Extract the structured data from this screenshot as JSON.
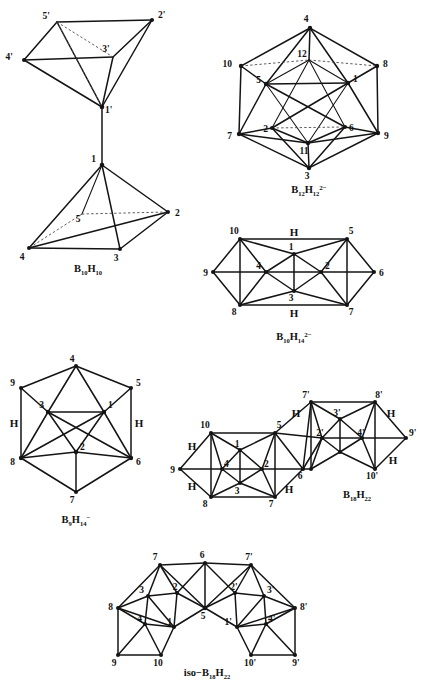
{
  "figure": {
    "background_color": "#ffffff",
    "line_color": "#141414",
    "structure_count": 6
  },
  "structures": [
    {
      "id": "b10h10",
      "name": "bisdisphenoid-bicapped-square-antiprism-diagram",
      "formula_plain": "B10H10",
      "formula": {
        "element1": "B",
        "sub1": "10",
        "element2": "H",
        "sub2": "10",
        "charge": ""
      },
      "vertex_labels": [
        "5'",
        "2'",
        "4'",
        "3'",
        "1'",
        "1",
        "5",
        "2",
        "4",
        "3"
      ],
      "bridge_labels": [],
      "vertices": [
        {
          "label": "5'",
          "x": 57,
          "y": 22,
          "lx": 50,
          "ly": 19,
          "dot": false
        },
        {
          "label": "2'",
          "x": 152,
          "y": 20,
          "lx": 158,
          "ly": 18,
          "dot": true
        },
        {
          "label": "4'",
          "x": 24,
          "y": 60,
          "lx": 13,
          "ly": 60,
          "dot": true
        },
        {
          "label": "3'",
          "x": 113,
          "y": 57,
          "lx": 106,
          "ly": 52,
          "dot": false
        },
        {
          "label": "1'",
          "x": 102,
          "y": 107,
          "lx": 105,
          "ly": 111,
          "dot": true
        },
        {
          "label": "1",
          "x": 102,
          "y": 165,
          "lx": 96,
          "ly": 162,
          "dot": true
        },
        {
          "label": "5",
          "x": 82,
          "y": 214,
          "lx": 78,
          "ly": 222,
          "dot": false
        },
        {
          "label": "2",
          "x": 168,
          "y": 212,
          "lx": 175,
          "ly": 215,
          "dot": true
        },
        {
          "label": "4",
          "x": 29,
          "y": 248,
          "lx": 22,
          "ly": 258,
          "dot": true
        },
        {
          "label": "3",
          "x": 120,
          "y": 249,
          "lx": 116,
          "ly": 260,
          "dot": true
        }
      ]
    },
    {
      "id": "b12h12",
      "name": "icosahedron-diagram",
      "formula_plain": "B12H12 2-",
      "formula": {
        "element1": "B",
        "sub1": "12",
        "element2": "H",
        "sub2": "12",
        "charge": "2−"
      },
      "vertex_labels": [
        "4",
        "12",
        "10",
        "8",
        "5",
        "1",
        "7",
        "9",
        "2",
        "6",
        "11",
        "3"
      ],
      "bridge_labels": [],
      "vertices": [
        {
          "label": "4",
          "x": 310,
          "y": 28,
          "lx": 306,
          "ly": 22,
          "dot": true
        },
        {
          "label": "12",
          "x": 309,
          "y": 60,
          "lx": 302,
          "ly": 56,
          "dot": false
        },
        {
          "label": "10",
          "x": 241,
          "y": 66,
          "lx": 228,
          "ly": 64,
          "dot": true
        },
        {
          "label": "8",
          "x": 377,
          "y": 66,
          "lx": 382,
          "ly": 64,
          "dot": true
        },
        {
          "label": "5",
          "x": 266,
          "y": 84,
          "lx": 260,
          "ly": 82,
          "dot": true
        },
        {
          "label": "1",
          "x": 348,
          "y": 83,
          "lx": 352,
          "ly": 81,
          "dot": true
        },
        {
          "label": "7",
          "x": 239,
          "y": 134,
          "lx": 228,
          "ly": 137,
          "dot": true
        },
        {
          "label": "9",
          "x": 378,
          "y": 133,
          "lx": 384,
          "ly": 136,
          "dot": true
        },
        {
          "label": "2",
          "x": 272,
          "y": 128,
          "lx": 266,
          "ly": 131,
          "dot": true
        },
        {
          "label": "6",
          "x": 345,
          "y": 127,
          "lx": 349,
          "ly": 130,
          "dot": true
        },
        {
          "label": "11",
          "x": 308,
          "y": 143,
          "lx": 301,
          "ly": 152,
          "dot": true
        },
        {
          "label": "3",
          "x": 309,
          "y": 168,
          "lx": 305,
          "ly": 178,
          "dot": true
        }
      ]
    },
    {
      "id": "b10h14",
      "name": "decaborane-open-cage-diagram",
      "formula_plain": "B10H14 2-",
      "formula": {
        "element1": "B",
        "sub1": "10",
        "element2": "H",
        "sub2": "14",
        "charge": "2−"
      },
      "vertex_labels": [
        "10",
        "5",
        "9",
        "4",
        "1",
        "2",
        "6",
        "8",
        "3",
        "7"
      ],
      "bridge_labels": [
        "H",
        "H"
      ],
      "vertices": [
        {
          "label": "10",
          "x": 240,
          "y": 239,
          "lx": 233,
          "ly": 233,
          "dot": true
        },
        {
          "label": "5",
          "x": 347,
          "y": 239,
          "lx": 351,
          "ly": 233,
          "dot": true
        },
        {
          "label": "9",
          "x": 213,
          "y": 272,
          "lx": 203,
          "ly": 275,
          "dot": true
        },
        {
          "label": "4",
          "x": 266,
          "y": 272,
          "lx": 259,
          "ly": 268,
          "dot": true
        },
        {
          "label": "1",
          "x": 294,
          "y": 254,
          "lx": 290,
          "ly": 249,
          "dot": true
        },
        {
          "label": "2",
          "x": 321,
          "y": 272,
          "lx": 317,
          "ly": 267,
          "dot": true
        },
        {
          "label": "6",
          "x": 374,
          "y": 272,
          "lx": 380,
          "ly": 275,
          "dot": true
        },
        {
          "label": "8",
          "x": 240,
          "y": 305,
          "lx": 233,
          "ly": 313,
          "dot": true
        },
        {
          "label": "3",
          "x": 294,
          "y": 291,
          "lx": 290,
          "ly": 300,
          "dot": true
        },
        {
          "label": "7",
          "x": 347,
          "y": 305,
          "lx": 351,
          "ly": 313,
          "dot": true
        }
      ],
      "bridges": [
        {
          "label": "H",
          "x": 294,
          "y": 234
        },
        {
          "label": "H",
          "x": 294,
          "y": 313
        }
      ]
    },
    {
      "id": "b9h14",
      "name": "nonaborane-anion-diagram",
      "formula_plain": "B9H14 -",
      "formula": {
        "element1": "B",
        "sub1": "9",
        "element2": "H",
        "sub2": "14",
        "charge": "−"
      },
      "vertex_labels": [
        "4",
        "9",
        "5",
        "3",
        "1",
        "8",
        "2",
        "6",
        "7"
      ],
      "bridge_labels": [
        "H",
        "H"
      ],
      "vertices": [
        {
          "label": "4",
          "x": 76,
          "y": 366,
          "lx": 72,
          "ly": 361,
          "dot": true
        },
        {
          "label": "9",
          "x": 21,
          "y": 388,
          "lx": 11,
          "ly": 386,
          "dot": true
        },
        {
          "label": "5",
          "x": 131,
          "y": 388,
          "lx": 136,
          "ly": 386,
          "dot": true
        },
        {
          "label": "3",
          "x": 48,
          "y": 412,
          "lx": 41,
          "ly": 408,
          "dot": true
        },
        {
          "label": "1",
          "x": 104,
          "y": 412,
          "lx": 100,
          "ly": 408,
          "dot": true
        },
        {
          "label": "8",
          "x": 21,
          "y": 458,
          "lx": 11,
          "ly": 462,
          "dot": true
        },
        {
          "label": "2",
          "x": 76,
          "y": 452,
          "lx": 79,
          "ly": 449,
          "dot": true
        },
        {
          "label": "6",
          "x": 131,
          "y": 458,
          "lx": 136,
          "ly": 462,
          "dot": true
        },
        {
          "label": "7",
          "x": 76,
          "y": 492,
          "lx": 72,
          "ly": 502,
          "dot": true
        }
      ],
      "bridges": [
        {
          "label": "H",
          "x": 14,
          "y": 424
        },
        {
          "label": "H",
          "x": 139,
          "y": 424
        }
      ]
    },
    {
      "id": "b18h22",
      "name": "octadecaborane-diagram",
      "formula_plain": "B18H22",
      "formula": {
        "element1": "B",
        "sub1": "18",
        "element2": "H",
        "sub2": "22",
        "charge": ""
      },
      "vertex_labels": [
        "10",
        "5",
        "9",
        "4",
        "1",
        "2",
        "6",
        "8",
        "3",
        "7",
        "7'",
        "8'",
        "3'",
        "2'",
        "4'",
        "9'",
        "10'"
      ],
      "bridge_labels": [
        "H",
        "H",
        "H",
        "H",
        "H",
        "H"
      ],
      "vertices": [
        {
          "label": "10",
          "x": 211,
          "y": 433,
          "lx": 204,
          "ly": 428,
          "dot": true
        },
        {
          "label": "5",
          "x": 275,
          "y": 433,
          "lx": 279,
          "ly": 428,
          "dot": true
        },
        {
          "label": "9",
          "x": 180,
          "y": 469,
          "lx": 171,
          "ly": 471,
          "dot": true
        },
        {
          "label": "4",
          "x": 222,
          "y": 469,
          "lx": 224,
          "ly": 466,
          "dot": true
        },
        {
          "label": "1",
          "x": 240,
          "y": 450,
          "lx": 236,
          "ly": 446,
          "dot": true
        },
        {
          "label": "2",
          "x": 262,
          "y": 469,
          "lx": 258,
          "ly": 466,
          "dot": true
        },
        {
          "label": "6",
          "x": 303,
          "y": 469,
          "lx": 300,
          "ly": 477,
          "dot": true
        },
        {
          "label": "8",
          "x": 211,
          "y": 497,
          "lx": 205,
          "ly": 505,
          "dot": true
        },
        {
          "label": "3",
          "x": 240,
          "y": 483,
          "lx": 236,
          "ly": 492,
          "dot": true
        },
        {
          "label": "7",
          "x": 275,
          "y": 497,
          "lx": 271,
          "ly": 505,
          "dot": true
        },
        {
          "label": "7'",
          "x": 311,
          "y": 402,
          "lx": 306,
          "ly": 398,
          "dot": true
        },
        {
          "label": "8'",
          "x": 375,
          "y": 402,
          "lx": 379,
          "ly": 398,
          "dot": true
        },
        {
          "label": "3'",
          "x": 340,
          "y": 419,
          "lx": 336,
          "ly": 415,
          "dot": true
        },
        {
          "label": "2'",
          "x": 322,
          "y": 438,
          "lx": 318,
          "ly": 434,
          "dot": true
        },
        {
          "label": "4'",
          "x": 362,
          "y": 438,
          "lx": 358,
          "ly": 434,
          "dot": true
        },
        {
          "label": "9'",
          "x": 406,
          "y": 438,
          "lx": 408,
          "ly": 435,
          "dot": true
        },
        {
          "label": "10'",
          "x": 375,
          "y": 469,
          "lx": 371,
          "ly": 477,
          "dot": true
        }
      ],
      "bridges": [
        {
          "label": "H",
          "x": 192,
          "y": 447
        },
        {
          "label": "H",
          "x": 192,
          "y": 487
        },
        {
          "label": "H",
          "x": 289,
          "y": 490
        },
        {
          "label": "H",
          "x": 296,
          "y": 414
        },
        {
          "label": "H",
          "x": 391,
          "y": 414
        },
        {
          "label": "H",
          "x": 393,
          "y": 461
        }
      ]
    },
    {
      "id": "iso-b18h22",
      "name": "iso-octadecaborane-diagram",
      "formula_plain": "iso-B18H22",
      "formula": {
        "prefix": "iso−",
        "element1": "B",
        "sub1": "18",
        "element2": "H",
        "sub2": "22",
        "charge": ""
      },
      "vertex_labels": [
        "7",
        "6",
        "7'",
        "3",
        "2",
        "2'",
        "3'",
        "8",
        "8'",
        "4",
        "1",
        "5",
        "1'",
        "4'",
        "9",
        "10",
        "10'",
        "9'"
      ],
      "bridge_labels": [],
      "vertices": [
        {
          "label": "7",
          "x": 160,
          "y": 565,
          "lx": 155,
          "ly": 560,
          "dot": true
        },
        {
          "label": "6",
          "x": 205,
          "y": 563,
          "lx": 202,
          "ly": 558,
          "dot": true
        },
        {
          "label": "7'",
          "x": 251,
          "y": 565,
          "lx": 249,
          "ly": 560,
          "dot": true
        },
        {
          "label": "3",
          "x": 148,
          "y": 596,
          "lx": 142,
          "ly": 592,
          "dot": true
        },
        {
          "label": "2",
          "x": 177,
          "y": 593,
          "lx": 173,
          "ly": 589,
          "dot": true
        },
        {
          "label": "2'",
          "x": 235,
          "y": 593,
          "lx": 231,
          "ly": 589,
          "dot": true
        },
        {
          "label": "3'",
          "x": 264,
          "y": 596,
          "lx": 262,
          "ly": 592,
          "dot": true
        },
        {
          "label": "8",
          "x": 118,
          "y": 608,
          "lx": 110,
          "ly": 607,
          "dot": true
        },
        {
          "label": "8'",
          "x": 295,
          "y": 608,
          "lx": 299,
          "ly": 607,
          "dot": true
        },
        {
          "label": "4",
          "x": 145,
          "y": 624,
          "lx": 140,
          "ly": 621,
          "dot": true
        },
        {
          "label": "1",
          "x": 174,
          "y": 627,
          "lx": 171,
          "ly": 625,
          "dot": true
        },
        {
          "label": "5",
          "x": 205,
          "y": 608,
          "lx": 203,
          "ly": 616,
          "dot": true
        },
        {
          "label": "1'",
          "x": 237,
          "y": 627,
          "lx": 233,
          "ly": 625,
          "dot": true
        },
        {
          "label": "4'",
          "x": 266,
          "y": 624,
          "lx": 263,
          "ly": 621,
          "dot": true
        },
        {
          "label": "9",
          "x": 118,
          "y": 655,
          "lx": 111,
          "ly": 663,
          "dot": true
        },
        {
          "label": "10",
          "x": 161,
          "y": 655,
          "lx": 155,
          "ly": 663,
          "dot": true
        },
        {
          "label": "10'",
          "x": 251,
          "y": 655,
          "lx": 246,
          "ly": 663,
          "dot": true
        },
        {
          "label": "9'",
          "x": 295,
          "y": 655,
          "lx": 292,
          "ly": 663,
          "dot": true
        }
      ]
    }
  ],
  "captions": [
    {
      "id": "cap-b10h10",
      "x": 88,
      "y": 271
    },
    {
      "id": "cap-b12h12",
      "x": 309,
      "y": 192
    },
    {
      "id": "cap-b10h14",
      "x": 294,
      "y": 339
    },
    {
      "id": "cap-b9h14",
      "x": 76,
      "y": 522
    },
    {
      "id": "cap-b18h22",
      "x": 357,
      "y": 497
    },
    {
      "id": "cap-iso",
      "x": 207,
      "y": 675
    }
  ]
}
